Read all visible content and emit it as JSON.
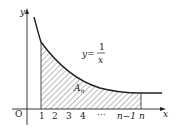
{
  "diagram": {
    "axis_x_label": "x",
    "axis_y_label": "y",
    "origin_label": "O",
    "function_label_lhs": "y=",
    "function_numerator": "1",
    "function_denominator": "x",
    "area_label_main": "A",
    "area_label_sub": "n",
    "x_ticks": [
      "1",
      "2",
      "3",
      "4",
      "···",
      "n−1",
      "n"
    ],
    "colors": {
      "stroke": "#222222",
      "hatch": "#555555",
      "background": "#ffffff"
    }
  }
}
